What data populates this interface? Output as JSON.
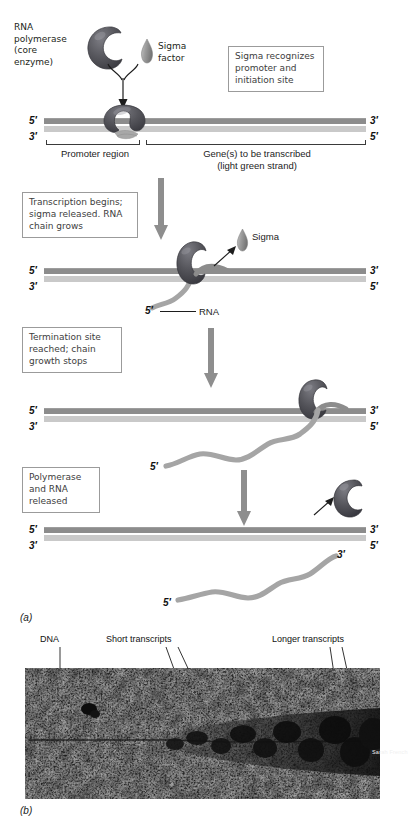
{
  "figure": {
    "panel_a_letter": "(a)",
    "panel_b_letter": "(b)",
    "credit": "Sarah French"
  },
  "step1": {
    "enzyme_label": "RNA\npolymerase\n(core\nenzyme)",
    "sigma_label": "Sigma\nfactor",
    "callout": "Sigma recognizes\npromoter and\ninitiation site",
    "dna_left_top": "5′",
    "dna_left_bottom": "3′",
    "dna_right_top": "3′",
    "dna_right_bottom": "5′",
    "promoter_label": "Promoter region",
    "gene_label": "Gene(s) to be transcribed\n(light green strand)"
  },
  "step2": {
    "callout": "Transcription begins;\nsigma released. RNA\nchain grows",
    "sigma_label": "Sigma",
    "rna_label": "RNA",
    "rna_prime": "5′",
    "dna_left_top": "5′",
    "dna_left_bottom": "3′",
    "dna_right_top": "3′",
    "dna_right_bottom": "5′"
  },
  "step3": {
    "callout": "Termination site\nreached; chain\ngrowth stops",
    "rna_prime": "5′",
    "dna_left_top": "5′",
    "dna_left_bottom": "3′",
    "dna_right_top": "3′",
    "dna_right_bottom": "5′"
  },
  "step4": {
    "callout": "Polymerase\nand RNA\nreleased",
    "rna_prime_5": "5′",
    "rna_prime_3": "3′",
    "dna_left_top": "5′",
    "dna_left_bottom": "3′",
    "dna_right_top": "3′",
    "dna_right_bottom": "5′"
  },
  "micrograph": {
    "dna_label": "DNA",
    "short_transcripts_label": "Short transcripts",
    "longer_transcripts_label": "Longer transcripts"
  },
  "colors": {
    "dna_template_strand": "#8c8c8c",
    "dna_coding_strand": "#c9c9c9",
    "polymerase": "#5a5a5e",
    "sigma": "#9a9a9a",
    "rna": "#a5a5a5",
    "arrow": "#8e8e8e",
    "callout_border": "#9b9b9b",
    "text": "#231f20"
  }
}
